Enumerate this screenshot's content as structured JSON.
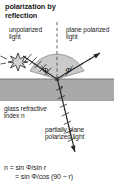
{
  "figure": {
    "title": "polarization by\nreflection",
    "title_line1": "polarization by",
    "title_line2": "reflection",
    "labels": {
      "unpolarized": "unpolarized light",
      "plane_polarized": "plane polarized light",
      "glass": "glass refractive index n",
      "partially_polarized": "partially plane polarized light"
    },
    "angles": {
      "incident": "Φ",
      "reflected": "Φ",
      "refracted": "r"
    },
    "formula": {
      "line1": "n = sin Φ/sin r",
      "line2": "= sin Φ/cos (90 − r)"
    },
    "colors": {
      "glass_fill": "#a9a9a9",
      "glass_edge": "#8a8a8a",
      "fan_fill": "#c9c9c9",
      "ray_stroke": "#2a2a2a",
      "text": "#1c1c1c",
      "background": "#ffffff"
    },
    "icons": {
      "source": "starburst-icon",
      "normal": "dashed-normal-line",
      "incident_ray": "incident-ray-arrow",
      "reflected_ray": "reflected-ray-arrow",
      "refracted_ray": "refracted-ray-arrow"
    }
  }
}
